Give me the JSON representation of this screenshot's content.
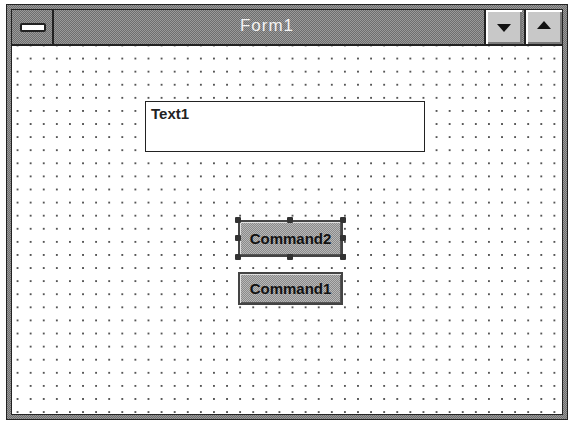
{
  "window": {
    "title": "Form1",
    "system_menu_icon": "system-menu-bar-icon",
    "minimize_icon": "triangle-down-icon",
    "maximize_icon": "triangle-up-icon"
  },
  "form": {
    "grid": "dotted-design-grid",
    "textbox": {
      "value": "Text1"
    },
    "buttons": [
      {
        "label": "Command2",
        "selected": true
      },
      {
        "label": "Command1",
        "selected": false
      }
    ]
  },
  "colors": {
    "titlebar_dither": "#9a9a9a",
    "frame": "#222222",
    "client_background": "#ffffff",
    "grid_dot": "#555555"
  }
}
